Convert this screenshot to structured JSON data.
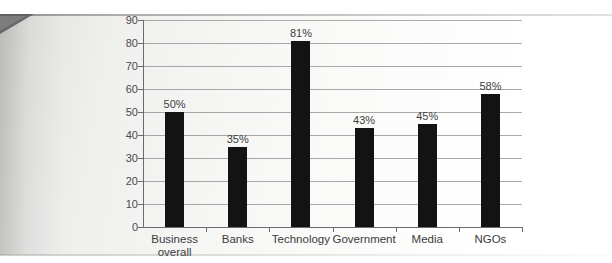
{
  "chart_data": {
    "type": "bar",
    "title": "",
    "subtitle": "",
    "xlabel": "",
    "ylabel": "",
    "categories": [
      "Business overall",
      "Banks",
      "Technology",
      "Government",
      "Media",
      "NGOs"
    ],
    "values": [
      50,
      35,
      81,
      43,
      45,
      58
    ],
    "data_labels": [
      "50%",
      "35%",
      "81%",
      "43%",
      "45%",
      "58%"
    ],
    "ylim": [
      0,
      90
    ],
    "ytick_step": 10,
    "ytick_labels": [
      "90",
      "80",
      "70",
      "60",
      "50",
      "40",
      "30",
      "20",
      "10",
      "0"
    ],
    "ytick_values": [
      90,
      80,
      70,
      60,
      50,
      40,
      30,
      20,
      10,
      0
    ],
    "grid": true,
    "grid_axis": "y",
    "legend": false,
    "legend_position": "none",
    "bar_color": "#131313",
    "grid_color": "#8c8c8c",
    "axis_color": "#6b6b6b",
    "label_color": "#3b3b3b",
    "background_color": "#f2f2f1"
  }
}
